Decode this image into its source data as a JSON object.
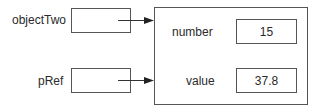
{
  "references": [
    {
      "label": "objectTwo"
    },
    {
      "label": "pRef"
    }
  ],
  "object": {
    "fields": [
      {
        "name": "number",
        "value": "15"
      },
      {
        "name": "value",
        "value": "37.8"
      }
    ]
  },
  "colors": {
    "stroke": "#555555",
    "text": "#2a2a2a"
  }
}
